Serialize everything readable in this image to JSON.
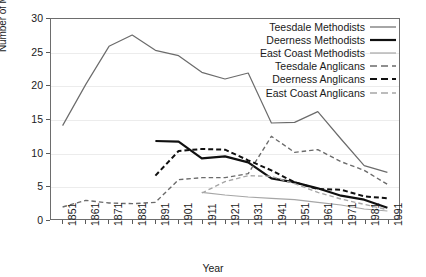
{
  "chart_data": {
    "type": "line",
    "title": "",
    "xlabel": "Year",
    "ylabel": "Number of Methodists/Anglicans",
    "x": [
      1851,
      1861,
      1871,
      1881,
      1891,
      1901,
      1911,
      1921,
      1931,
      1941,
      1951,
      1961,
      1971,
      1981,
      1991
    ],
    "xtick_labels": [
      "1851",
      "1861",
      "1871",
      "1881",
      "1891",
      "1901",
      "1911",
      "1921",
      "1931",
      "1941",
      "1951",
      "1961",
      "1971",
      "1981",
      "1991"
    ],
    "ytick_labels": [
      "0",
      "5",
      "10",
      "15",
      "20",
      "25",
      "30"
    ],
    "yticks": [
      0,
      5,
      10,
      15,
      20,
      25,
      30
    ],
    "xlim": [
      1846,
      1996
    ],
    "ylim": [
      0,
      30
    ],
    "grid": "horizontal",
    "legend_position": "top-right-inside",
    "series": [
      {
        "name": "Teesdale Methodists",
        "color": "#6b6b6b",
        "width": 1.2,
        "dash": "solid",
        "values": [
          14.0,
          20.2,
          25.9,
          27.6,
          25.3,
          24.5,
          22.0,
          21.0,
          21.9,
          14.4,
          14.5,
          16.1,
          12.0,
          8.0,
          7.0
        ]
      },
      {
        "name": "Deerness Methodists",
        "color": "#101010",
        "width": 2.2,
        "dash": "solid",
        "values": [
          null,
          null,
          null,
          null,
          11.7,
          11.6,
          9.1,
          9.4,
          8.5,
          6.1,
          5.5,
          4.6,
          3.5,
          2.9,
          1.7
        ]
      },
      {
        "name": "East Coast Methodists",
        "color": "#a6a6a6",
        "width": 1.2,
        "dash": "solid",
        "values": [
          null,
          null,
          null,
          null,
          null,
          null,
          4.0,
          3.6,
          3.3,
          3.1,
          2.9,
          2.5,
          2.1,
          1.5,
          1.2
        ]
      },
      {
        "name": "Teesdale Anglicans",
        "color": "#6b6b6b",
        "width": 1.4,
        "dash": "dashed",
        "values": [
          1.8,
          2.8,
          2.4,
          2.3,
          2.5,
          5.9,
          6.2,
          6.2,
          6.8,
          12.4,
          10.0,
          10.4,
          8.6,
          7.3,
          5.2
        ]
      },
      {
        "name": "Deerness Anglicans",
        "color": "#101010",
        "width": 2.0,
        "dash": "dashed",
        "values": [
          null,
          null,
          null,
          null,
          6.5,
          10.2,
          10.5,
          10.4,
          8.8,
          7.3,
          5.5,
          4.5,
          4.4,
          3.4,
          3.1
        ]
      },
      {
        "name": "East Coast Anglicans",
        "color": "#a6a6a6",
        "width": 1.4,
        "dash": "dashed",
        "values": [
          null,
          null,
          null,
          null,
          null,
          null,
          3.9,
          5.6,
          6.5,
          6.4,
          5.3,
          4.0,
          3.0,
          2.2,
          1.4
        ]
      }
    ]
  }
}
